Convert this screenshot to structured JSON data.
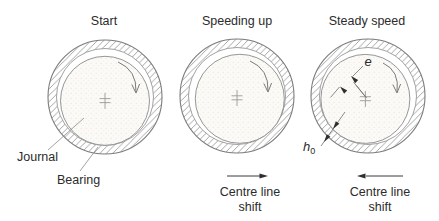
{
  "diagram": {
    "type": "journal-bearing-lubrication-stages",
    "panels": [
      {
        "title": "Start"
      },
      {
        "title": "Speeding up",
        "shift": {
          "line1": "Centre line",
          "line2": "shift",
          "direction": "right"
        }
      },
      {
        "title": "Steady speed",
        "shift": {
          "line1": "Centre line",
          "line2": "shift",
          "direction": "left"
        }
      }
    ],
    "labels": {
      "journal": "Journal",
      "bearing": "Bearing",
      "eccentricity_symbol": "e",
      "min_film_symbol": "h",
      "min_film_subscript": "0"
    },
    "rotation": "clockwise",
    "colors": {
      "line": "#7c7c7c",
      "hatch": "#909090",
      "annotation": "#6e6e6e",
      "arrowhead": "#2f2f2f",
      "text": "#2b2b2b",
      "journal_fill": "#fbfaf7",
      "background": "#ffffff"
    }
  }
}
